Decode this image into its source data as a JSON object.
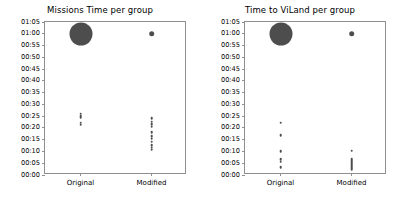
{
  "figure": {
    "background": "#ffffff",
    "marker_color": "#4d4d4d",
    "axis_color": "#8f8f8f",
    "text_color": "#000000"
  },
  "chart_data": [
    {
      "type": "scatter",
      "title": "Missions Time per group",
      "xlabel": "",
      "ylabel": "",
      "categories": [
        "Original",
        "Modified"
      ],
      "ytick_labels": [
        "00:00",
        "00:05",
        "00:10",
        "00:15",
        "00:20",
        "00:25",
        "00:30",
        "00:35",
        "00:40",
        "00:45",
        "00:50",
        "00:55",
        "01:00",
        "01:05"
      ],
      "ytick_values": [
        0,
        5,
        10,
        15,
        20,
        25,
        30,
        35,
        40,
        45,
        50,
        55,
        60,
        65
      ],
      "ylim": [
        0,
        65
      ],
      "grid": false,
      "legend": false,
      "series": [
        {
          "name": "Original",
          "x_category": "Original",
          "points": [
            {
              "y": 60.0,
              "size": 23.0
            },
            {
              "y": 26.0,
              "size": 2.6
            },
            {
              "y": 25.2,
              "size": 2.6
            },
            {
              "y": 24.6,
              "size": 2.6
            },
            {
              "y": 22.2,
              "size": 2.6
            },
            {
              "y": 21.4,
              "size": 2.6
            }
          ]
        },
        {
          "name": "Modified",
          "x_category": "Modified",
          "points": [
            {
              "y": 60.0,
              "size": 5.6
            },
            {
              "y": 24.2,
              "size": 2.6
            },
            {
              "y": 22.6,
              "size": 2.6
            },
            {
              "y": 21.6,
              "size": 2.6
            },
            {
              "y": 20.6,
              "size": 2.6
            },
            {
              "y": 18.2,
              "size": 2.6
            },
            {
              "y": 16.6,
              "size": 2.6
            },
            {
              "y": 15.4,
              "size": 2.6
            },
            {
              "y": 14.2,
              "size": 2.6
            },
            {
              "y": 12.6,
              "size": 2.6
            },
            {
              "y": 11.6,
              "size": 2.6
            },
            {
              "y": 10.8,
              "size": 2.6
            }
          ]
        }
      ]
    },
    {
      "type": "scatter",
      "title": "Time to ViLand per group",
      "xlabel": "",
      "ylabel": "",
      "categories": [
        "Original",
        "Modified"
      ],
      "ytick_labels": [
        "00:00",
        "00:05",
        "00:10",
        "00:15",
        "00:20",
        "00:25",
        "00:30",
        "00:35",
        "00:40",
        "00:45",
        "00:50",
        "00:55",
        "01:00",
        "01:05"
      ],
      "ytick_values": [
        0,
        5,
        10,
        15,
        20,
        25,
        30,
        35,
        40,
        45,
        50,
        55,
        60,
        65
      ],
      "ylim": [
        0,
        65
      ],
      "grid": false,
      "legend": false,
      "series": [
        {
          "name": "Original",
          "x_category": "Original",
          "points": [
            {
              "y": 60.0,
              "size": 23.0
            },
            {
              "y": 22.2,
              "size": 2.6
            },
            {
              "y": 17.0,
              "size": 2.6
            },
            {
              "y": 10.0,
              "size": 2.6
            },
            {
              "y": 6.6,
              "size": 2.6
            },
            {
              "y": 5.6,
              "size": 2.6
            },
            {
              "y": 3.2,
              "size": 2.6
            }
          ]
        },
        {
          "name": "Modified",
          "x_category": "Modified",
          "points": [
            {
              "y": 60.0,
              "size": 5.6
            },
            {
              "y": 10.4,
              "size": 2.6
            },
            {
              "y": 7.0,
              "size": 2.6
            },
            {
              "y": 6.2,
              "size": 2.6
            },
            {
              "y": 5.4,
              "size": 2.6
            },
            {
              "y": 4.6,
              "size": 2.6
            },
            {
              "y": 3.8,
              "size": 2.6
            },
            {
              "y": 3.0,
              "size": 2.6
            },
            {
              "y": 2.2,
              "size": 2.6
            }
          ]
        }
      ]
    }
  ]
}
